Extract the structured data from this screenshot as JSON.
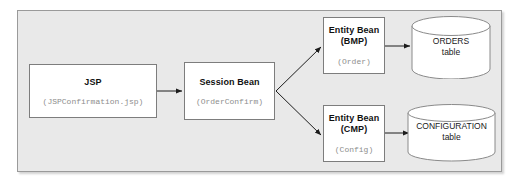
{
  "diagram": {
    "background_color": "#e9e9e9",
    "border_color": "#9a9a9a",
    "nodes": {
      "jsp": {
        "title": "JSP",
        "code": "(JSPConfirmation.jsp)",
        "shape": "rectangle"
      },
      "session_bean": {
        "title": "Session Bean",
        "code": "(OrderConfirm)",
        "shape": "rectangle"
      },
      "entity_bean_bmp": {
        "title": "Entity Bean",
        "subtitle": "(BMP)",
        "code": "(Order)",
        "shape": "rectangle"
      },
      "entity_bean_cmp": {
        "title": "Entity Bean",
        "subtitle": "(CMP)",
        "code": "(Config)",
        "shape": "rectangle"
      },
      "orders_table": {
        "line1": "ORDERS",
        "line2": "table",
        "shape": "cylinder"
      },
      "configuration_table": {
        "line1": "CONFIGURATION",
        "line2": "table",
        "shape": "cylinder"
      }
    },
    "edges": [
      {
        "from": "jsp",
        "to": "session_bean",
        "style": "arrow"
      },
      {
        "from": "session_bean",
        "to": "entity_bean_bmp",
        "style": "arrow"
      },
      {
        "from": "session_bean",
        "to": "entity_bean_cmp",
        "style": "arrow"
      },
      {
        "from": "entity_bean_bmp",
        "to": "orders_table",
        "style": "arrow"
      },
      {
        "from": "entity_bean_cmp",
        "to": "configuration_table",
        "style": "arrow"
      }
    ]
  }
}
